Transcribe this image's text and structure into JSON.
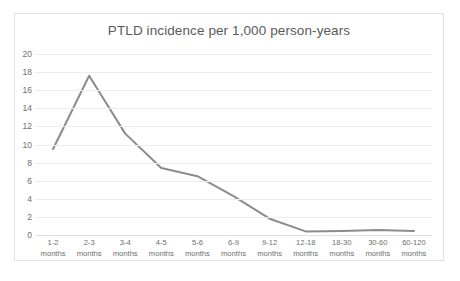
{
  "chart_data": {
    "type": "line",
    "title": "PTLD incidence per 1,000 person-years",
    "xlabel": "",
    "ylabel": "",
    "categories": [
      "1-2 months",
      "2-3 months",
      "3-4 months",
      "4-5 months",
      "5-6 months",
      "6-9 months",
      "9-12 months",
      "12-18 months",
      "18-30 months",
      "30-60 months",
      "60-120 months"
    ],
    "category_ranges": [
      "1-2",
      "2-3",
      "3-4",
      "4-5",
      "5-6",
      "6-9",
      "9-12",
      "12-18",
      "18-30",
      "30-60",
      "60-120"
    ],
    "category_unit": "months",
    "values": [
      9.5,
      17.6,
      11.2,
      7.4,
      6.5,
      4.3,
      1.8,
      0.4,
      0.45,
      0.55,
      0.45
    ],
    "ylim": [
      0,
      20
    ],
    "ytick_step": 2,
    "ytick_labels": [
      "20",
      "18",
      "16",
      "14",
      "12",
      "10",
      "8",
      "6",
      "4",
      "2",
      "0"
    ],
    "grid": true,
    "grid_axis": "y",
    "legend": false,
    "legend_position": "none",
    "series_color": "#8c8c8c",
    "grid_color": "#ededed",
    "text_color": "#6e6e6e",
    "title_color": "#5a5a5a",
    "border_color": "#e2e2e2",
    "background": "#ffffff"
  }
}
